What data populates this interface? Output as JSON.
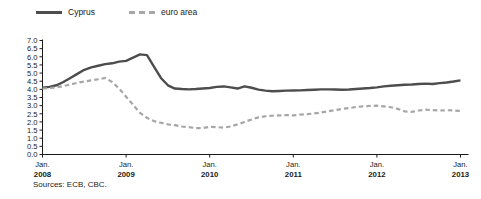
{
  "chart_data": {
    "type": "line",
    "title": "",
    "xlabel": "",
    "ylabel": "",
    "ylim": [
      0.0,
      7.0
    ],
    "ytick_step": 0.5,
    "yticks": [
      "7.0",
      "6.5",
      "6.0",
      "5.5",
      "5.0",
      "4.5",
      "4.0",
      "3.5",
      "3.0",
      "2.5",
      "2.0",
      "1.5",
      "1.0",
      "0.5",
      "0.0"
    ],
    "grid": false,
    "legend_position": "top-left",
    "x_axis": {
      "major_ticks": [
        {
          "month": "Jan.",
          "year": "2008"
        },
        {
          "month": "Jan.",
          "year": "2009"
        },
        {
          "month": "Jan.",
          "year": "2010"
        },
        {
          "month": "Jan.",
          "year": "2011"
        },
        {
          "month": "Jan.",
          "year": "2012"
        },
        {
          "month": "Jan.",
          "year": "2013"
        }
      ],
      "x_start": "2008-01",
      "x_end": "2013-01",
      "points_per_year": 12
    },
    "series": [
      {
        "name": "Cyprus",
        "color": "#4d4d4d",
        "style": "solid",
        "values": [
          4.1,
          4.15,
          4.25,
          4.45,
          4.7,
          4.95,
          5.2,
          5.35,
          5.45,
          5.55,
          5.6,
          5.7,
          5.75,
          5.95,
          6.15,
          6.1,
          5.4,
          4.7,
          4.25,
          4.05,
          4.02,
          4.0,
          4.02,
          4.05,
          4.08,
          4.15,
          4.18,
          4.12,
          4.05,
          4.18,
          4.1,
          3.98,
          3.92,
          3.88,
          3.9,
          3.92,
          3.93,
          3.94,
          3.96,
          3.98,
          4.0,
          4.0,
          3.99,
          3.98,
          3.99,
          4.02,
          4.05,
          4.08,
          4.12,
          4.18,
          4.22,
          4.25,
          4.28,
          4.3,
          4.33,
          4.35,
          4.33,
          4.38,
          4.42,
          4.48,
          4.55
        ]
      },
      {
        "name": "euro area",
        "color": "#a6a6a6",
        "style": "dashed",
        "values": [
          4.05,
          4.08,
          4.12,
          4.2,
          4.3,
          4.4,
          4.48,
          4.55,
          4.62,
          4.7,
          4.45,
          4.05,
          3.55,
          3.05,
          2.55,
          2.25,
          2.05,
          1.95,
          1.85,
          1.8,
          1.72,
          1.68,
          1.62,
          1.62,
          1.7,
          1.68,
          1.65,
          1.72,
          1.85,
          2.0,
          2.15,
          2.28,
          2.35,
          2.38,
          2.4,
          2.42,
          2.4,
          2.45,
          2.48,
          2.52,
          2.58,
          2.65,
          2.72,
          2.8,
          2.85,
          2.92,
          2.95,
          2.98,
          3.0,
          2.95,
          2.9,
          2.8,
          2.65,
          2.62,
          2.7,
          2.75,
          2.72,
          2.7,
          2.72,
          2.7,
          2.68
        ]
      }
    ],
    "source_note": "Sources: ECB, CBC."
  },
  "legend": {
    "entries": [
      {
        "label": "Cyprus"
      },
      {
        "label": "euro area"
      }
    ]
  },
  "footer": {
    "sources": "Sources: ECB, CBC."
  }
}
